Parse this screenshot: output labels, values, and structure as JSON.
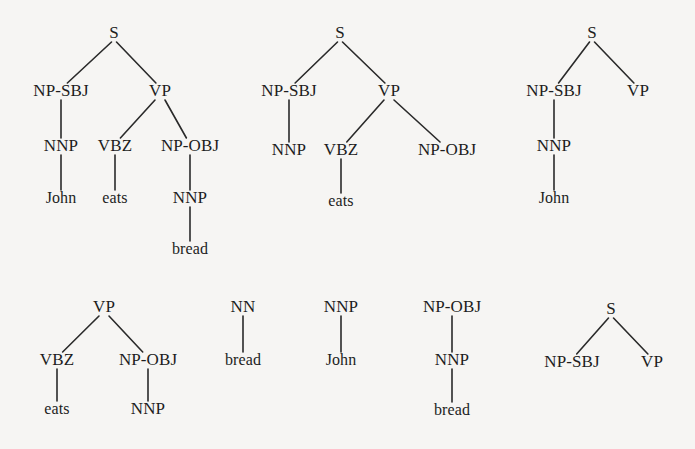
{
  "figure": {
    "kind": "syntactic-parse-tree-fragments",
    "background_color": "#f6f5f3",
    "ink_color": "#1d1d1d",
    "width": 695,
    "height": 449,
    "trees": [
      {
        "id": "tree-1",
        "name": "full-parse-john-eats-bread",
        "nodes": [
          {
            "id": "t1-s",
            "label": "S",
            "x": 114,
            "y": 38,
            "type": "nonterminal"
          },
          {
            "id": "t1-npsbj",
            "label": "NP-SBJ",
            "x": 61,
            "y": 96,
            "type": "nonterminal"
          },
          {
            "id": "t1-vp",
            "label": "VP",
            "x": 160,
            "y": 96,
            "type": "nonterminal"
          },
          {
            "id": "t1-nnp",
            "label": "NNP",
            "x": 61,
            "y": 151,
            "type": "preterminal"
          },
          {
            "id": "t1-vbz",
            "label": "VBZ",
            "x": 115,
            "y": 151,
            "type": "preterminal"
          },
          {
            "id": "t1-npobj",
            "label": "NP-OBJ",
            "x": 190,
            "y": 151,
            "type": "nonterminal"
          },
          {
            "id": "t1-john",
            "label": "John",
            "x": 61,
            "y": 203,
            "type": "terminal"
          },
          {
            "id": "t1-eats",
            "label": "eats",
            "x": 115,
            "y": 203,
            "type": "terminal"
          },
          {
            "id": "t1-nnp2",
            "label": "NNP",
            "x": 190,
            "y": 203,
            "type": "preterminal"
          },
          {
            "id": "t1-bread",
            "label": "bread",
            "x": 190,
            "y": 254,
            "type": "terminal"
          }
        ],
        "edges": [
          {
            "from": "t1-s",
            "to": "t1-npsbj"
          },
          {
            "from": "t1-s",
            "to": "t1-vp"
          },
          {
            "from": "t1-npsbj",
            "to": "t1-nnp"
          },
          {
            "from": "t1-vp",
            "to": "t1-vbz"
          },
          {
            "from": "t1-vp",
            "to": "t1-npobj"
          },
          {
            "from": "t1-nnp",
            "to": "t1-john"
          },
          {
            "from": "t1-vbz",
            "to": "t1-eats"
          },
          {
            "from": "t1-npobj",
            "to": "t1-nnp2"
          },
          {
            "from": "t1-nnp2",
            "to": "t1-bread"
          }
        ]
      },
      {
        "id": "tree-2",
        "name": "partial-parse-eats-only",
        "nodes": [
          {
            "id": "t2-s",
            "label": "S",
            "x": 340,
            "y": 38,
            "type": "nonterminal"
          },
          {
            "id": "t2-npsbj",
            "label": "NP-SBJ",
            "x": 289,
            "y": 96,
            "type": "nonterminal"
          },
          {
            "id": "t2-vp",
            "label": "VP",
            "x": 389,
            "y": 96,
            "type": "nonterminal"
          },
          {
            "id": "t2-nnp",
            "label": "NNP",
            "x": 289,
            "y": 155,
            "type": "preterminal"
          },
          {
            "id": "t2-vbz",
            "label": "VBZ",
            "x": 341,
            "y": 155,
            "type": "preterminal"
          },
          {
            "id": "t2-npobj",
            "label": "NP-OBJ",
            "x": 447,
            "y": 155,
            "type": "nonterminal"
          },
          {
            "id": "t2-eats",
            "label": "eats",
            "x": 341,
            "y": 206,
            "type": "terminal"
          }
        ],
        "edges": [
          {
            "from": "t2-s",
            "to": "t2-npsbj"
          },
          {
            "from": "t2-s",
            "to": "t2-vp"
          },
          {
            "from": "t2-npsbj",
            "to": "t2-nnp"
          },
          {
            "from": "t2-vp",
            "to": "t2-vbz"
          },
          {
            "from": "t2-vp",
            "to": "t2-npobj"
          },
          {
            "from": "t2-vbz",
            "to": "t2-eats"
          }
        ]
      },
      {
        "id": "tree-3",
        "name": "partial-parse-john-subject",
        "nodes": [
          {
            "id": "t3-s",
            "label": "S",
            "x": 592,
            "y": 38,
            "type": "nonterminal"
          },
          {
            "id": "t3-npsbj",
            "label": "NP-SBJ",
            "x": 554,
            "y": 96,
            "type": "nonterminal"
          },
          {
            "id": "t3-vp",
            "label": "VP",
            "x": 638,
            "y": 96,
            "type": "nonterminal"
          },
          {
            "id": "t3-nnp",
            "label": "NNP",
            "x": 554,
            "y": 151,
            "type": "preterminal"
          },
          {
            "id": "t3-john",
            "label": "John",
            "x": 554,
            "y": 203,
            "type": "terminal"
          }
        ],
        "edges": [
          {
            "from": "t3-s",
            "to": "t3-npsbj"
          },
          {
            "from": "t3-s",
            "to": "t3-vp"
          },
          {
            "from": "t3-npsbj",
            "to": "t3-nnp"
          },
          {
            "from": "t3-nnp",
            "to": "t3-john"
          }
        ]
      },
      {
        "id": "tree-4",
        "name": "vp-fragment-eats-object",
        "nodes": [
          {
            "id": "t4-vp",
            "label": "VP",
            "x": 104,
            "y": 312,
            "type": "nonterminal"
          },
          {
            "id": "t4-vbz",
            "label": "VBZ",
            "x": 57,
            "y": 365,
            "type": "preterminal"
          },
          {
            "id": "t4-npobj",
            "label": "NP-OBJ",
            "x": 148,
            "y": 365,
            "type": "nonterminal"
          },
          {
            "id": "t4-eats",
            "label": "eats",
            "x": 57,
            "y": 414,
            "type": "terminal"
          },
          {
            "id": "t4-nnp",
            "label": "NNP",
            "x": 148,
            "y": 414,
            "type": "preterminal"
          }
        ],
        "edges": [
          {
            "from": "t4-vp",
            "to": "t4-vbz"
          },
          {
            "from": "t4-vp",
            "to": "t4-npobj"
          },
          {
            "from": "t4-vbz",
            "to": "t4-eats"
          },
          {
            "from": "t4-npobj",
            "to": "t4-nnp"
          }
        ]
      },
      {
        "id": "tree-5",
        "name": "nn-bread-fragment",
        "nodes": [
          {
            "id": "t5-nn",
            "label": "NN",
            "x": 243,
            "y": 312,
            "type": "preterminal"
          },
          {
            "id": "t5-bread",
            "label": "bread",
            "x": 243,
            "y": 365,
            "type": "terminal"
          }
        ],
        "edges": [
          {
            "from": "t5-nn",
            "to": "t5-bread"
          }
        ]
      },
      {
        "id": "tree-6",
        "name": "nnp-john-fragment",
        "nodes": [
          {
            "id": "t6-nnp",
            "label": "NNP",
            "x": 341,
            "y": 312,
            "type": "preterminal"
          },
          {
            "id": "t6-john",
            "label": "John",
            "x": 341,
            "y": 365,
            "type": "terminal"
          }
        ],
        "edges": [
          {
            "from": "t6-nnp",
            "to": "t6-john"
          }
        ]
      },
      {
        "id": "tree-7",
        "name": "npobj-bread-fragment",
        "nodes": [
          {
            "id": "t7-npobj",
            "label": "NP-OBJ",
            "x": 452,
            "y": 312,
            "type": "nonterminal"
          },
          {
            "id": "t7-nnp",
            "label": "NNP",
            "x": 452,
            "y": 365,
            "type": "preterminal"
          },
          {
            "id": "t7-bread",
            "label": "bread",
            "x": 452,
            "y": 415,
            "type": "terminal"
          }
        ],
        "edges": [
          {
            "from": "t7-npobj",
            "to": "t7-nnp"
          },
          {
            "from": "t7-nnp",
            "to": "t7-bread"
          }
        ]
      },
      {
        "id": "tree-8",
        "name": "s-skeleton-fragment",
        "nodes": [
          {
            "id": "t8-s",
            "label": "S",
            "x": 611,
            "y": 314,
            "type": "nonterminal"
          },
          {
            "id": "t8-npsbj",
            "label": "NP-SBJ",
            "x": 572,
            "y": 367,
            "type": "nonterminal"
          },
          {
            "id": "t8-vp",
            "label": "VP",
            "x": 652,
            "y": 367,
            "type": "nonterminal"
          }
        ],
        "edges": [
          {
            "from": "t8-s",
            "to": "t8-npsbj"
          },
          {
            "from": "t8-s",
            "to": "t8-vp"
          }
        ]
      }
    ]
  }
}
